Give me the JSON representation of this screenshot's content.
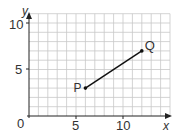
{
  "chart_data": {
    "type": "line",
    "title": "",
    "xlabel": "x",
    "ylabel": "y",
    "xlim": [
      0,
      15
    ],
    "ylim": [
      0,
      11
    ],
    "grid": true,
    "x_ticks": [
      "5",
      "10"
    ],
    "y_ticks": [
      "5",
      "10"
    ],
    "origin_label": "0",
    "points": [
      {
        "label": "P",
        "x": 6,
        "y": 3
      },
      {
        "label": "Q",
        "x": 12,
        "y": 7
      }
    ],
    "series": [
      {
        "name": "PQ",
        "x": [
          6,
          12
        ],
        "y": [
          3,
          7
        ]
      }
    ]
  },
  "labels": {
    "x_axis": "x",
    "y_axis": "y",
    "origin": "0",
    "x_tick_5": "5",
    "x_tick_10": "10",
    "y_tick_5": "5",
    "y_tick_10": "10",
    "point_p": "P",
    "point_q": "Q"
  },
  "colors": {
    "grid": "#c8c8c8",
    "axis": "#222222",
    "segment": "#111111"
  }
}
